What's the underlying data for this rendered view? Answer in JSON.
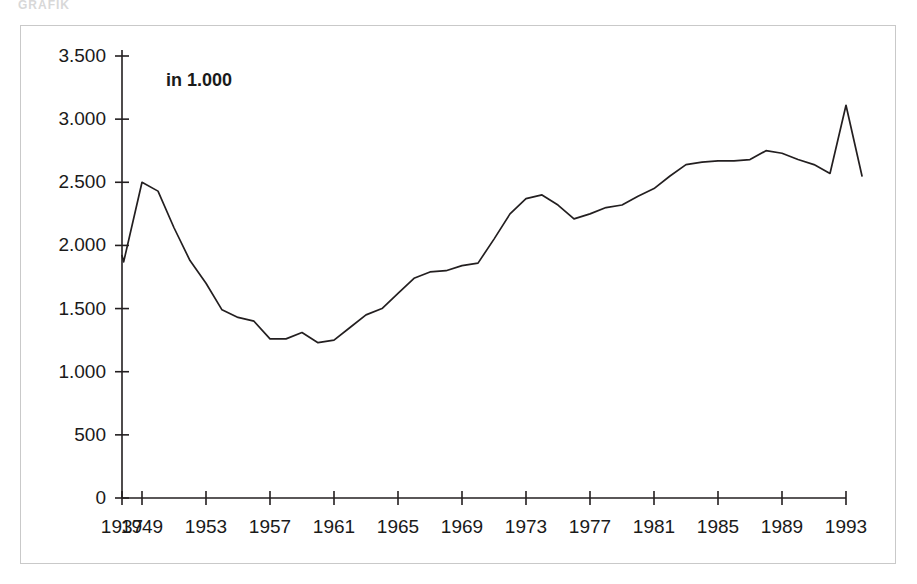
{
  "top_clipped_text": "GRAFIK",
  "chart_data": {
    "type": "line",
    "title": "",
    "subtitle": "",
    "unit_note": "in 1.000",
    "xlabel": "",
    "ylabel": "",
    "xlim": [
      1937,
      1993
    ],
    "ylim": [
      0,
      3500
    ],
    "grid": false,
    "legend": null,
    "y_ticks": [
      0,
      500,
      1000,
      1500,
      2000,
      2500,
      3000,
      3500
    ],
    "y_tick_labels": [
      "0",
      "500",
      "1.000",
      "1.500",
      "2.000",
      "2.500",
      "3.000",
      "3.500"
    ],
    "x_ticks": [
      1937,
      1949,
      1953,
      1957,
      1961,
      1965,
      1969,
      1973,
      1977,
      1981,
      1985,
      1989,
      1993
    ],
    "x_tick_labels": [
      "1937",
      "1949",
      "1953",
      "1957",
      "1961",
      "1965",
      "1969",
      "1973",
      "1977",
      "1981",
      "1985",
      "1989",
      "1993"
    ],
    "series": [
      {
        "name": "value",
        "color": "#231f20",
        "x": [
          1937,
          1938,
          1949,
          1950,
          1951,
          1952,
          1953,
          1954,
          1955,
          1956,
          1957,
          1958,
          1959,
          1960,
          1961,
          1962,
          1963,
          1964,
          1965,
          1966,
          1967,
          1968,
          1969,
          1970,
          1971,
          1972,
          1973,
          1974,
          1975,
          1976,
          1977,
          1978,
          1979,
          1980,
          1981,
          1982,
          1983,
          1984,
          1985,
          1986,
          1987,
          1988,
          1989,
          1990,
          1991,
          1992,
          1993
        ],
        "y": [
          1920,
          1880,
          2500,
          2440,
          2150,
          1880,
          1700,
          1490,
          1430,
          1410,
          1260,
          1260,
          1310,
          1230,
          1250,
          1350,
          1450,
          1500,
          1620,
          1740,
          1790,
          1800,
          1840,
          1860,
          2050,
          2250,
          2370,
          2400,
          2320,
          2210,
          2250,
          2300,
          2320,
          2390,
          2450,
          2550,
          2640,
          2660,
          2670,
          2670,
          2680,
          2750,
          2730,
          2680,
          2640,
          2690,
          2790
        ],
        "y_full": [
          1920,
          1880,
          2500,
          2440,
          2150,
          1880,
          1700,
          1490,
          1430,
          1410,
          1260,
          1260,
          1310,
          1230,
          1250,
          1350,
          1450,
          1500,
          1620,
          1740,
          1790,
          1800,
          1840,
          1860,
          2050,
          2250,
          2370,
          2400,
          2320,
          2210,
          2250,
          2300,
          2320,
          2390,
          2450,
          2550,
          2640,
          2660,
          2670,
          2670,
          2680,
          2750,
          2730,
          2680,
          2640,
          2570,
          3110,
          2550
        ]
      }
    ],
    "points": [
      {
        "x": 1937,
        "y": 1920
      },
      {
        "x": 1938,
        "y": 1870
      },
      {
        "x": 1949,
        "y": 2500
      },
      {
        "x": 1950,
        "y": 2430
      },
      {
        "x": 1951,
        "y": 2140
      },
      {
        "x": 1952,
        "y": 1880
      },
      {
        "x": 1953,
        "y": 1700
      },
      {
        "x": 1954,
        "y": 1490
      },
      {
        "x": 1955,
        "y": 1430
      },
      {
        "x": 1956,
        "y": 1400
      },
      {
        "x": 1957,
        "y": 1260
      },
      {
        "x": 1958,
        "y": 1260
      },
      {
        "x": 1959,
        "y": 1310
      },
      {
        "x": 1960,
        "y": 1230
      },
      {
        "x": 1961,
        "y": 1250
      },
      {
        "x": 1962,
        "y": 1350
      },
      {
        "x": 1963,
        "y": 1450
      },
      {
        "x": 1964,
        "y": 1500
      },
      {
        "x": 1965,
        "y": 1620
      },
      {
        "x": 1966,
        "y": 1740
      },
      {
        "x": 1967,
        "y": 1790
      },
      {
        "x": 1968,
        "y": 1800
      },
      {
        "x": 1969,
        "y": 1840
      },
      {
        "x": 1970,
        "y": 1860
      },
      {
        "x": 1971,
        "y": 2050
      },
      {
        "x": 1972,
        "y": 2250
      },
      {
        "x": 1973,
        "y": 2370
      },
      {
        "x": 1974,
        "y": 2400
      },
      {
        "x": 1975,
        "y": 2320
      },
      {
        "x": 1976,
        "y": 2210
      },
      {
        "x": 1977,
        "y": 2250
      },
      {
        "x": 1978,
        "y": 2300
      },
      {
        "x": 1979,
        "y": 2320
      },
      {
        "x": 1980,
        "y": 2390
      },
      {
        "x": 1981,
        "y": 2450
      },
      {
        "x": 1982,
        "y": 2550
      },
      {
        "x": 1983,
        "y": 2640
      },
      {
        "x": 1984,
        "y": 2660
      },
      {
        "x": 1985,
        "y": 2670
      },
      {
        "x": 1986,
        "y": 2670
      },
      {
        "x": 1987,
        "y": 2680
      },
      {
        "x": 1988,
        "y": 2750
      },
      {
        "x": 1989,
        "y": 2730
      },
      {
        "x": 1990,
        "y": 2680
      },
      {
        "x": 1991,
        "y": 2640
      },
      {
        "x": 1992,
        "y": 2570
      },
      {
        "x": 1993,
        "y": 3110
      },
      {
        "x": 1994,
        "y": 2550
      }
    ],
    "annotations": [
      {
        "text": "in 1.000",
        "role": "unit-note",
        "position": "top-left-inside"
      }
    ],
    "axis_color": "#231f20",
    "line_color": "#231f20",
    "background_color": "#ffffff",
    "frame_color": "#c9c9c9"
  }
}
